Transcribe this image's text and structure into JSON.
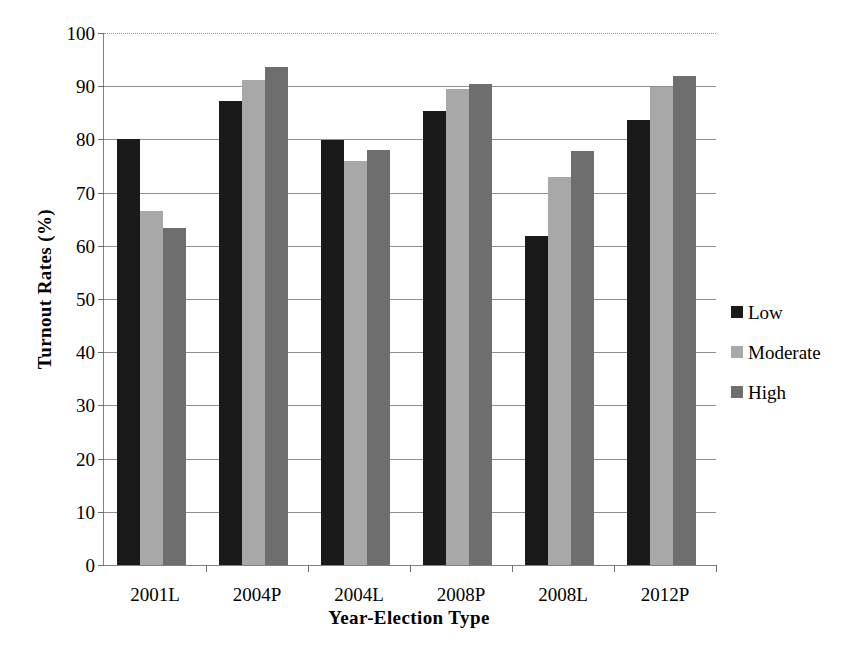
{
  "chart_data": {
    "type": "bar",
    "title": "",
    "xlabel": "Year-Election Type",
    "ylabel": "Turnout Rates (%)",
    "categories": [
      "2001L",
      "2004P",
      "2004L",
      "2008P",
      "2008L",
      "2012P"
    ],
    "series": [
      {
        "name": "Low",
        "color": "#1a1a1a",
        "values": [
          80.0,
          87.2,
          79.8,
          85.3,
          61.8,
          83.6
        ]
      },
      {
        "name": "Moderate",
        "color": "#a8a8a8",
        "values": [
          66.5,
          91.2,
          76.0,
          89.4,
          73.0,
          89.8
        ]
      },
      {
        "name": "High",
        "color": "#6e6e6e",
        "values": [
          63.3,
          93.6,
          78.0,
          90.5,
          77.8,
          92.0
        ]
      }
    ],
    "ylim": [
      0,
      100
    ],
    "yticks": [
      0,
      10,
      20,
      30,
      40,
      50,
      60,
      70,
      80,
      90,
      100
    ],
    "ytick_labels": [
      "0",
      "10",
      "20",
      "30",
      "40",
      "50",
      "60",
      "70",
      "80",
      "90",
      "100"
    ],
    "grid": true,
    "legend_position": "right",
    "legend": [
      "Low",
      "Moderate",
      "High"
    ]
  }
}
